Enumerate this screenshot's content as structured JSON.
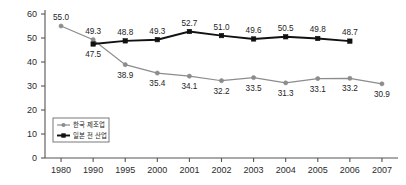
{
  "chart_data": {
    "type": "line",
    "title": "",
    "subtitle": "",
    "xlabel": "",
    "ylabel": "",
    "x": [
      "1980",
      "1990",
      "1995",
      "2000",
      "2001",
      "2002",
      "2003",
      "2004",
      "2005",
      "2006",
      "2007"
    ],
    "categories": [
      "1980",
      "1990",
      "1995",
      "2000",
      "2001",
      "2002",
      "2003",
      "2004",
      "2005",
      "2006",
      "2007"
    ],
    "xtick_labels": [
      "1980",
      "1990",
      "1995",
      "2000",
      "2001",
      "2002",
      "2003",
      "2004",
      "2005",
      "2006",
      "2007"
    ],
    "ytick_labels": [
      "0",
      "10",
      "20",
      "30",
      "40",
      "50",
      "60"
    ],
    "ytick_values": [
      0,
      10,
      20,
      30,
      40,
      50,
      60
    ],
    "ylim": [
      0,
      60
    ],
    "grid": false,
    "legend_position": "inner-lower-left",
    "series": [
      {
        "name": "한국 제조업",
        "color": "#8c8c8c",
        "marker": "circle",
        "values": [
          55.0,
          49.3,
          38.9,
          35.4,
          34.1,
          32.2,
          33.5,
          31.3,
          33.1,
          33.2,
          30.9
        ],
        "data_labels": [
          "55.0",
          "49.3",
          "38.9",
          "35.4",
          "34.1",
          "32.2",
          "33.5",
          "31.3",
          "33.1",
          "33.2",
          "30.9"
        ],
        "label_positions": [
          "above",
          "above",
          "below",
          "below",
          "below",
          "below",
          "below",
          "below",
          "below",
          "below",
          "below"
        ]
      },
      {
        "name": "일본 전 산업",
        "color": "#111111",
        "marker": "square",
        "values": [
          null,
          47.5,
          48.8,
          49.3,
          52.7,
          51.0,
          49.6,
          50.5,
          49.8,
          48.7,
          null
        ],
        "data_labels": [
          null,
          "47.5",
          "48.8",
          "49.3",
          "52.7",
          "51.0",
          "49.6",
          "50.5",
          "49.8",
          "48.7",
          null
        ],
        "label_positions": [
          null,
          "below",
          "above",
          "above",
          "above",
          "above",
          "above",
          "above",
          "above",
          "above",
          null
        ]
      }
    ],
    "annotations": []
  },
  "legend": {
    "items": [
      {
        "label": "한국 제조업",
        "color": "#8c8c8c",
        "marker": "circle"
      },
      {
        "label": "일본 전 산업",
        "color": "#111111",
        "marker": "square"
      }
    ]
  },
  "colors": {
    "axis": "#555555",
    "text": "#1d1d1d",
    "background": "#ffffff",
    "korea_manufacturing": "#8c8c8c",
    "japan_all_industries": "#111111"
  }
}
